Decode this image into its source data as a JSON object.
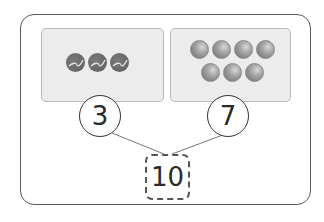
{
  "diagram": {
    "type": "number-bond",
    "left_part": {
      "value": "3",
      "object": "tennis-ball",
      "count": 3
    },
    "right_part": {
      "value": "7",
      "object": "marble",
      "count": 7
    },
    "whole": {
      "value": "10"
    }
  }
}
